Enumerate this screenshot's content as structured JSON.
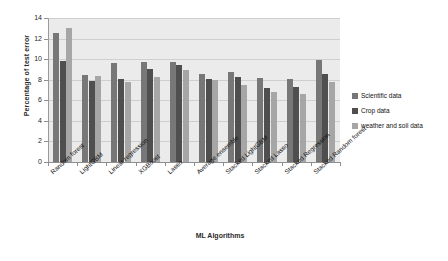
{
  "chart_data": {
    "type": "bar",
    "title": "",
    "xlabel": "ML Algorithms",
    "ylabel": "Percentage of test error",
    "ylim": [
      0,
      14
    ],
    "ytick_labels": [
      "0",
      "2",
      "4",
      "6",
      "8",
      "10",
      "12",
      "14"
    ],
    "ytick_values": [
      0,
      2,
      4,
      6,
      8,
      10,
      12,
      14
    ],
    "grid": true,
    "legend_position": "right",
    "categories": [
      "Random forest",
      "LightGBM",
      "Linear regression",
      "XGBoost",
      "Lasso",
      "Average ensemble",
      "Stacked LightGBM",
      "Stacked Lasso",
      "Stacked Regression",
      "Stacked Random  forest"
    ],
    "series": [
      {
        "name": "Scientific data",
        "color": "#777777",
        "values": [
          12.5,
          8.5,
          9.6,
          9.7,
          9.7,
          8.6,
          8.8,
          8.2,
          8.1,
          9.9
        ]
      },
      {
        "name": "Crop data",
        "color": "#4f4f4f",
        "values": [
          9.8,
          7.9,
          8.1,
          9.0,
          9.4,
          8.1,
          8.3,
          7.2,
          7.3,
          8.6
        ]
      },
      {
        "name": "weather and soil data",
        "color": "#a6a6a6",
        "values": [
          13.0,
          8.4,
          7.8,
          8.3,
          8.9,
          8.0,
          7.5,
          6.8,
          6.6,
          7.8
        ]
      }
    ]
  },
  "legend": {
    "items": [
      {
        "label": "Scientific data",
        "color": "#777777"
      },
      {
        "label": "Crop data",
        "color": "#4f4f4f"
      },
      {
        "label": "weather and soil data",
        "color": "#a6a6a6"
      }
    ]
  }
}
